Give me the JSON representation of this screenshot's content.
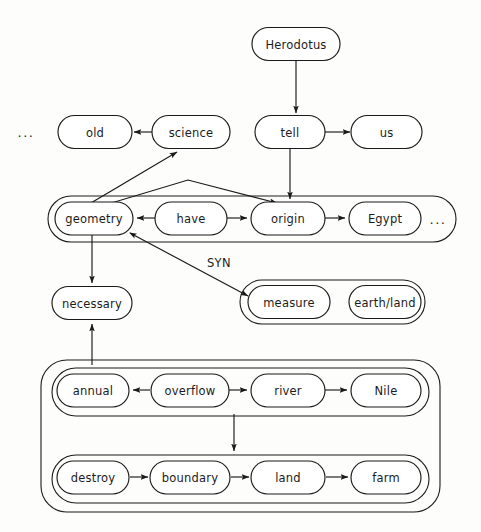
{
  "diagram": {
    "type": "concept-graph",
    "background_color": "#fdfdfc",
    "line_color": "#1a1a1a",
    "text_color": "#1c1c1c",
    "nodes": [
      {
        "id": "herodotus",
        "label": "Herodotus",
        "x": 296,
        "y": 44,
        "w": 88,
        "h": 33
      },
      {
        "id": "old",
        "label": "old",
        "x": 95,
        "y": 132,
        "w": 74,
        "h": 33
      },
      {
        "id": "science",
        "label": "science",
        "x": 191,
        "y": 132,
        "w": 78,
        "h": 33
      },
      {
        "id": "tell",
        "label": "tell",
        "x": 290,
        "y": 132,
        "w": 70,
        "h": 33
      },
      {
        "id": "us",
        "label": "us",
        "x": 387,
        "y": 132,
        "w": 71,
        "h": 33
      },
      {
        "id": "geometry",
        "label": "geometry",
        "x": 94,
        "y": 218,
        "w": 78,
        "h": 33
      },
      {
        "id": "have",
        "label": "have",
        "x": 191,
        "y": 218,
        "w": 72,
        "h": 33
      },
      {
        "id": "origin",
        "label": "origin",
        "x": 288,
        "y": 218,
        "w": 74,
        "h": 33
      },
      {
        "id": "egypt",
        "label": "Egypt",
        "x": 385,
        "y": 218,
        "w": 72,
        "h": 33
      },
      {
        "id": "necessary",
        "label": "necessary",
        "x": 92,
        "y": 303,
        "w": 80,
        "h": 33
      },
      {
        "id": "measure",
        "label": "measure",
        "x": 289,
        "y": 301,
        "w": 82,
        "h": 33
      },
      {
        "id": "earthland",
        "label": "earth/land",
        "x": 385,
        "y": 301,
        "w": 72,
        "h": 33
      },
      {
        "id": "annual",
        "label": "annual",
        "x": 93,
        "y": 390,
        "w": 72,
        "h": 33
      },
      {
        "id": "overflow",
        "label": "overflow",
        "x": 190,
        "y": 390,
        "w": 78,
        "h": 33
      },
      {
        "id": "river",
        "label": "river",
        "x": 288,
        "y": 390,
        "w": 74,
        "h": 33
      },
      {
        "id": "nile",
        "label": "Nile",
        "x": 386,
        "y": 390,
        "w": 70,
        "h": 33
      },
      {
        "id": "destroy",
        "label": "destroy",
        "x": 93,
        "y": 477,
        "w": 72,
        "h": 33
      },
      {
        "id": "boundary",
        "label": "boundary",
        "x": 190,
        "y": 477,
        "w": 80,
        "h": 33
      },
      {
        "id": "land",
        "label": "land",
        "x": 288,
        "y": 477,
        "w": 74,
        "h": 33
      },
      {
        "id": "farm",
        "label": "farm",
        "x": 386,
        "y": 477,
        "w": 70,
        "h": 33
      }
    ],
    "groups": [
      {
        "id": "geometry-group",
        "label": "",
        "x": 48,
        "y": 196,
        "w": 408,
        "h": 46
      },
      {
        "id": "measure-group",
        "label": "",
        "x": 240,
        "y": 280,
        "w": 185,
        "h": 44
      },
      {
        "id": "nile-outer",
        "label": "",
        "x": 41,
        "y": 360,
        "w": 399,
        "h": 152
      },
      {
        "id": "overflow-group",
        "label": "",
        "x": 52,
        "y": 368,
        "w": 377,
        "h": 48
      },
      {
        "id": "destroy-group",
        "label": "",
        "x": 52,
        "y": 455,
        "w": 377,
        "h": 48
      }
    ],
    "edge_labels": [
      {
        "id": "syn-label",
        "label": "SYN",
        "x": 219,
        "y": 263
      }
    ],
    "ellipses": [
      {
        "id": "ellipsis-left",
        "label": "...",
        "x": 26,
        "y": 133
      },
      {
        "id": "ellipsis-right",
        "label": "...",
        "x": 438,
        "y": 220
      }
    ],
    "edges": [
      {
        "from": "herodotus",
        "to": "tell",
        "kind": "arrow"
      },
      {
        "from": "science",
        "to": "old",
        "kind": "arrow"
      },
      {
        "from": "tell",
        "to": "us",
        "kind": "arrow"
      },
      {
        "from": "tell",
        "to": "origin",
        "kind": "arrow"
      },
      {
        "from": "geometry",
        "to": "science",
        "kind": "arrow"
      },
      {
        "from": "geometry",
        "to": "origin",
        "kind": "arrow"
      },
      {
        "from": "have",
        "to": "geometry",
        "kind": "arrow"
      },
      {
        "from": "have",
        "to": "origin",
        "kind": "arrow"
      },
      {
        "from": "origin",
        "to": "egypt",
        "kind": "arrow"
      },
      {
        "from": "geometry",
        "to": "necessary",
        "kind": "arrow"
      },
      {
        "from": "geometry",
        "to": "measure-group",
        "kind": "double-arrow",
        "label": "SYN"
      },
      {
        "from": "overflow",
        "to": "annual",
        "kind": "arrow"
      },
      {
        "from": "overflow",
        "to": "river",
        "kind": "arrow"
      },
      {
        "from": "river",
        "to": "nile",
        "kind": "arrow"
      },
      {
        "from": "overflow-group",
        "to": "destroy-group",
        "kind": "arrow"
      },
      {
        "from": "destroy",
        "to": "boundary",
        "kind": "arrow"
      },
      {
        "from": "boundary",
        "to": "land",
        "kind": "arrow"
      },
      {
        "from": "land",
        "to": "farm",
        "kind": "arrow"
      },
      {
        "from": "nile-outer",
        "to": "necessary",
        "kind": "arrow"
      }
    ]
  }
}
